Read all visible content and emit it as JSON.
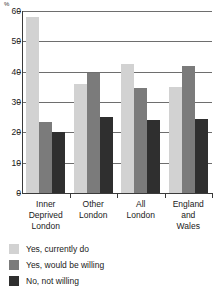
{
  "chart_data": {
    "type": "bar",
    "title": "",
    "xlabel": "",
    "ylabel": "%",
    "unit_symbol": "%",
    "ylim": [
      0,
      60
    ],
    "ytick_values": [
      0,
      10,
      20,
      30,
      40,
      50,
      60
    ],
    "ytick_labels": [
      "0",
      "10",
      "20",
      "30",
      "40",
      "50",
      "60"
    ],
    "grid": true,
    "legend_position": "below",
    "categories": [
      "Inner\nDeprived\nLondon",
      "Other\nLondon",
      "All\nLondon",
      "England\nand\nWales"
    ],
    "category_lines": [
      [
        "Inner",
        "Deprived",
        "London"
      ],
      [
        "Other",
        "London"
      ],
      [
        "All",
        "London"
      ],
      [
        "England",
        "and",
        "Wales"
      ]
    ],
    "series": [
      {
        "name": "Yes, currently do",
        "color": "#d2d2d2",
        "values": [
          58,
          36,
          42.5,
          35
        ]
      },
      {
        "name": "Yes, would be willing",
        "color": "#7b7b7b",
        "values": [
          23.5,
          39.5,
          34.5,
          42
        ]
      },
      {
        "name": "No, not willing",
        "color": "#2f2f2f",
        "values": [
          20,
          25,
          24,
          24.5
        ]
      }
    ]
  },
  "legend": {
    "items": [
      {
        "label": "Yes, currently do",
        "color": "#d2d2d2"
      },
      {
        "label": "Yes, would be willing",
        "color": "#7b7b7b"
      },
      {
        "label": "No, not willing",
        "color": "#2f2f2f"
      }
    ]
  }
}
